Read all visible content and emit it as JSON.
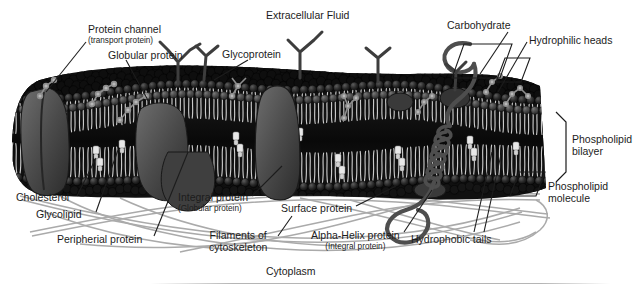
{
  "figure": {
    "background_color": "#ffffff",
    "ink_color": "#1c1c1c",
    "membrane_dark": "#121212",
    "membrane_mid": "#4a4a4a",
    "membrane_light": "#bfbfbf",
    "filament_color": "#9a9a9a"
  },
  "regions": {
    "top": "Extracellular Fluid",
    "bottom": "Cytoplasm"
  },
  "labels": {
    "protein_channel": {
      "main": "Protein channel",
      "sub": "(transport protein)"
    },
    "globular_protein": {
      "main": "Globular protein"
    },
    "glycoprotein": {
      "main": "Glycoprotein"
    },
    "carbohydrate": {
      "main": "Carbohydrate"
    },
    "hydrophilic_heads": {
      "main": "Hydrophilic heads"
    },
    "phospholipid_bilayer": {
      "main": "Phospholipid",
      "sub": "bilayer"
    },
    "phospholipid_molecule": {
      "main": "Phospholipid",
      "sub": "molecule"
    },
    "cholesterol": {
      "main": "Cholesterol"
    },
    "glycolipid": {
      "main": "Glycolipid"
    },
    "peripherial_protein": {
      "main": "Peripherial protein"
    },
    "integral_protein": {
      "main": "Integral protein",
      "sub": "(Globular protein)"
    },
    "surface_protein": {
      "main": "Surface protein"
    },
    "filaments": {
      "main": "Filaments of",
      "sub": "cytoskeleton"
    },
    "alpha_helix_protein": {
      "main": "Alpha-Helix protein",
      "sub": "(Integral protein)"
    },
    "hydrophobic_tails": {
      "main": "Hydrophobic tails"
    }
  }
}
